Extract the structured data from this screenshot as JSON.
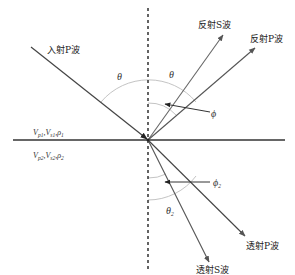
{
  "diagram": {
    "title": "",
    "labels": {
      "incident_p": "入射P波",
      "reflected_s": "反射S波",
      "reflected_p": "反射P波",
      "transmitted_p": "透射P波",
      "transmitted_s": "透射S波",
      "theta_left": "θ",
      "theta_right": "θ",
      "phi": "ϕ",
      "phi2": "ϕ",
      "phi2_sub": "2",
      "theta2": "θ",
      "theta2_sub": "2"
    },
    "media": {
      "upper": {
        "v_p": "V",
        "v_p_sub": "p1",
        "v_s": "V",
        "v_s_sub": "s1",
        "rho": "ρ",
        "rho_sub": "1",
        "sep": ","
      },
      "lower": {
        "v_p": "V",
        "v_p_sub": "p2",
        "v_s": "V",
        "v_s_sub": "s2",
        "rho": "ρ",
        "rho_sub": "2",
        "sep": ","
      }
    },
    "colors": {
      "interface": "#333333",
      "normal": "#222222",
      "rays": "#555555",
      "arcs": "#bbbbbb"
    }
  }
}
